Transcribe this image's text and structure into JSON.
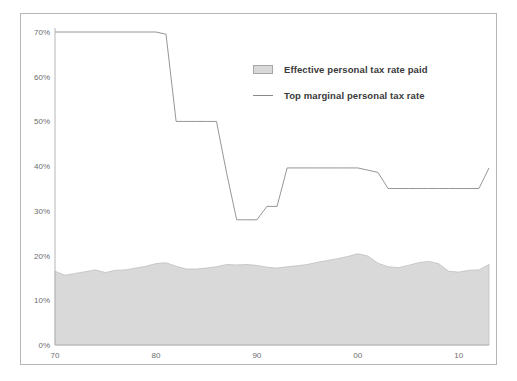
{
  "chart_data": {
    "type": "area",
    "title": "",
    "subtitle": "",
    "xlabel": "",
    "ylabel": "",
    "xlim": [
      1970,
      2013
    ],
    "ylim": [
      0,
      0.7
    ],
    "grid": false,
    "legend_position": "inside-top-right",
    "y_ticks": [
      {
        "value": 0.0,
        "label": "0%"
      },
      {
        "value": 0.1,
        "label": "10%"
      },
      {
        "value": 0.2,
        "label": "20%"
      },
      {
        "value": 0.3,
        "label": "30%"
      },
      {
        "value": 0.4,
        "label": "40%"
      },
      {
        "value": 0.5,
        "label": "50%"
      },
      {
        "value": 0.6,
        "label": "60%"
      },
      {
        "value": 0.7,
        "label": "70%"
      }
    ],
    "x_ticks": [
      {
        "value": 1970,
        "label": "70"
      },
      {
        "value": 1980,
        "label": "80"
      },
      {
        "value": 1990,
        "label": "90"
      },
      {
        "value": 2000,
        "label": "00"
      },
      {
        "value": 2010,
        "label": "10"
      }
    ],
    "colors": {
      "area_fill": "#d9d9d9",
      "area_stroke": "#bfbfbf",
      "line_stroke": "#8a8a8a",
      "axis": "#b6b6b6",
      "tick_text": "#6d6d6d",
      "legend_text": "#3a3a3a"
    },
    "series": [
      {
        "name": "Effective personal tax rate paid",
        "type": "area",
        "x": [
          1970,
          1971,
          1972,
          1973,
          1974,
          1975,
          1976,
          1977,
          1978,
          1979,
          1980,
          1981,
          1982,
          1983,
          1984,
          1985,
          1986,
          1987,
          1988,
          1989,
          1990,
          1991,
          1992,
          1993,
          1994,
          1995,
          1996,
          1997,
          1998,
          1999,
          2000,
          2001,
          2002,
          2003,
          2004,
          2005,
          2006,
          2007,
          2008,
          2009,
          2010,
          2011,
          2012,
          2013
        ],
        "values": [
          0.165,
          0.156,
          0.16,
          0.164,
          0.168,
          0.162,
          0.167,
          0.168,
          0.172,
          0.176,
          0.182,
          0.184,
          0.176,
          0.17,
          0.17,
          0.172,
          0.175,
          0.18,
          0.179,
          0.18,
          0.178,
          0.174,
          0.172,
          0.175,
          0.177,
          0.18,
          0.185,
          0.189,
          0.193,
          0.198,
          0.204,
          0.199,
          0.183,
          0.175,
          0.173,
          0.178,
          0.184,
          0.187,
          0.182,
          0.165,
          0.163,
          0.167,
          0.168,
          0.18
        ]
      },
      {
        "name": "Top marginal personal tax rate",
        "type": "line",
        "x": [
          1970,
          1971,
          1972,
          1973,
          1974,
          1975,
          1976,
          1977,
          1978,
          1979,
          1980,
          1981,
          1982,
          1983,
          1984,
          1985,
          1986,
          1987,
          1988,
          1989,
          1990,
          1991,
          1992,
          1993,
          1994,
          1995,
          1996,
          1997,
          1998,
          1999,
          2000,
          2001,
          2002,
          2003,
          2004,
          2005,
          2006,
          2007,
          2008,
          2009,
          2010,
          2011,
          2012,
          2013
        ],
        "values": [
          0.7,
          0.7,
          0.7,
          0.7,
          0.7,
          0.7,
          0.7,
          0.7,
          0.7,
          0.7,
          0.7,
          0.695,
          0.5,
          0.5,
          0.5,
          0.5,
          0.5,
          0.385,
          0.28,
          0.28,
          0.28,
          0.31,
          0.31,
          0.396,
          0.396,
          0.396,
          0.396,
          0.396,
          0.396,
          0.396,
          0.396,
          0.391,
          0.386,
          0.35,
          0.35,
          0.35,
          0.35,
          0.35,
          0.35,
          0.35,
          0.35,
          0.35,
          0.35,
          0.396
        ]
      }
    ]
  },
  "legend": {
    "entries": [
      {
        "label": "Effective personal tax rate paid",
        "marker": "area-swatch"
      },
      {
        "label": "Top marginal personal tax rate",
        "marker": "line-swatch"
      }
    ]
  }
}
